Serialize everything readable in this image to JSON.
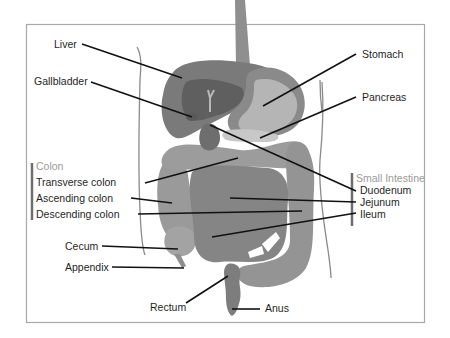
{
  "diagram": {
    "labels": {
      "liver": "Liver",
      "gallbladder": "Gallbladder",
      "stomach": "Stomach",
      "pancreas": "Pancreas",
      "transverse_colon": "Transverse colon",
      "ascending_colon": "Ascending colon",
      "descending_colon": "Descending colon",
      "cecum": "Cecum",
      "appendix": "Appendix",
      "rectum": "Rectum",
      "anus": "Anus",
      "duodenum": "Duodenum",
      "jejunum": "Jejunum",
      "ileum": "Ileum"
    },
    "groups": {
      "colon": "Colon",
      "small_intestine": "Small Intestine"
    },
    "colors": {
      "liver": "#7a7a7a",
      "liver_dark": "#5f5f5f",
      "stomach_outer": "#8a8a8a",
      "stomach_inner": "#b5b5b5",
      "intestine": "#8c8c8c",
      "colon": "#9a9a9a",
      "esophagus": "#8f8f8f",
      "pancreas": "#c8c8c8"
    }
  }
}
